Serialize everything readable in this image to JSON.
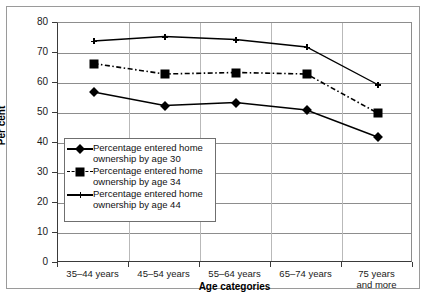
{
  "chart_data": {
    "type": "line",
    "title": "",
    "xlabel": "Age categories",
    "ylabel": "Per cent",
    "ylim": [
      0,
      80
    ],
    "yticks": [
      0,
      10,
      20,
      30,
      40,
      50,
      60,
      70,
      80
    ],
    "grid": true,
    "legend_position": "inside-lower-left",
    "categories": [
      "35–44 years",
      "45–54 years",
      "55–64 years",
      "65–74 years",
      "75 years and more"
    ],
    "category_lines": [
      [
        "35–44 years"
      ],
      [
        "45–54 years"
      ],
      [
        "55–64 years"
      ],
      [
        "65–74 years"
      ],
      [
        "75 years",
        "and more"
      ]
    ],
    "series": [
      {
        "name": "Percentage entered home ownership by age 30",
        "name_lines": [
          "Percentage entered home",
          "ownership by age 30"
        ],
        "marker": "diamond",
        "linestyle": "solid",
        "color": "#000000",
        "values": [
          57,
          52.5,
          53.5,
          51,
          42
        ]
      },
      {
        "name": "Percentage entered home ownership by age 34",
        "name_lines": [
          "Percentage entered home",
          "ownership by age 34"
        ],
        "marker": "square",
        "linestyle": "dash-dot",
        "color": "#000000",
        "values": [
          66.5,
          63,
          63.5,
          63,
          50
        ]
      },
      {
        "name": "Percentage entered home ownership by age 44",
        "name_lines": [
          "Percentage entered home",
          "ownership by age 44"
        ],
        "marker": "plus",
        "linestyle": "solid",
        "color": "#000000",
        "values": [
          74,
          75.5,
          74.5,
          72,
          59.5
        ]
      }
    ]
  }
}
